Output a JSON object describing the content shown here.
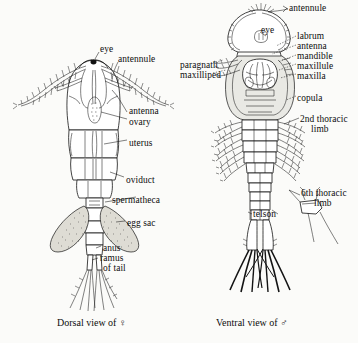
{
  "figure": {
    "background_color": "#fbfbf9",
    "ink_color": "#141414"
  },
  "panels": [
    {
      "id": "female-dorsal",
      "caption": "Dorsal view of ♀",
      "sex_symbol": "♀",
      "view": "Dorsal",
      "labels": [
        {
          "key": "eye",
          "text": "eye",
          "x": 100,
          "y": 48,
          "align": "left"
        },
        {
          "key": "antennule",
          "text": "antennule",
          "x": 118,
          "y": 58,
          "align": "left"
        },
        {
          "key": "antenna",
          "text": "antenna",
          "x": 129,
          "y": 110,
          "align": "left"
        },
        {
          "key": "ovary",
          "text": "ovary",
          "x": 129,
          "y": 121,
          "align": "left"
        },
        {
          "key": "uterus",
          "text": "uterus",
          "x": 129,
          "y": 142,
          "align": "left"
        },
        {
          "key": "oviduct",
          "text": "oviduct",
          "x": 126,
          "y": 179,
          "align": "left"
        },
        {
          "key": "spermatheca",
          "text": "spermatheca",
          "x": 112,
          "y": 199,
          "align": "left"
        },
        {
          "key": "egg-sac",
          "text": "egg sac",
          "x": 127,
          "y": 222,
          "align": "left"
        },
        {
          "key": "anus",
          "text": "anus",
          "x": 103,
          "y": 247,
          "align": "left"
        },
        {
          "key": "ramus",
          "text": "ramus",
          "x": 100,
          "y": 257,
          "align": "left"
        },
        {
          "key": "of-tail",
          "text": "of tail",
          "x": 103,
          "y": 267,
          "align": "left"
        }
      ]
    },
    {
      "id": "male-ventral",
      "caption": "Ventral view of ♂",
      "sex_symbol": "♂",
      "view": "Ventral",
      "labels": [
        {
          "key": "antennule",
          "text": "antennule",
          "x": 289,
          "y": 7,
          "align": "left"
        },
        {
          "key": "eye",
          "text": "eye",
          "x": 261,
          "y": 29,
          "align": "left"
        },
        {
          "key": "labrum",
          "text": "labrum",
          "x": 297,
          "y": 35,
          "align": "left"
        },
        {
          "key": "antenna",
          "text": "antenna",
          "x": 297,
          "y": 45,
          "align": "left"
        },
        {
          "key": "mandible",
          "text": "mandible",
          "x": 297,
          "y": 55,
          "align": "left"
        },
        {
          "key": "maxillule",
          "text": "maxillule",
          "x": 297,
          "y": 65,
          "align": "left"
        },
        {
          "key": "maxilla",
          "text": "maxilla",
          "x": 297,
          "y": 75,
          "align": "left"
        },
        {
          "key": "paragnath",
          "text": "paragnath",
          "x": 180,
          "y": 64,
          "align": "left"
        },
        {
          "key": "maxilliped",
          "text": "maxilliped",
          "x": 180,
          "y": 74,
          "align": "left"
        },
        {
          "key": "copula",
          "text": "copula",
          "x": 297,
          "y": 97,
          "align": "left"
        },
        {
          "key": "second-thoracic-limb",
          "text": "2nd thoracic",
          "x": 300,
          "y": 118,
          "align": "left"
        },
        {
          "key": "second-thoracic-limb-2",
          "text": "limb",
          "x": 311,
          "y": 128,
          "align": "left"
        },
        {
          "key": "sixth-thoracic-limb",
          "text": "6th thoracic",
          "x": 301,
          "y": 192,
          "align": "left"
        },
        {
          "key": "sixth-thoracic-limb-2",
          "text": "limb",
          "x": 314,
          "y": 202,
          "align": "left"
        },
        {
          "key": "telson",
          "text": "telson",
          "x": 253,
          "y": 213,
          "align": "left"
        }
      ]
    }
  ],
  "captions": [
    {
      "key": "female-caption",
      "text": "Dorsal view of ♀",
      "x": 57,
      "y": 324
    },
    {
      "key": "male-caption",
      "text": "Ventral view of ♂",
      "x": 216,
      "y": 324
    }
  ]
}
